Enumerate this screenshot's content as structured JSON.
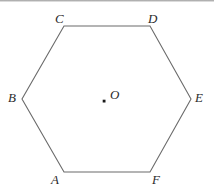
{
  "figure": {
    "name": "regular-hexagon-with-center",
    "background_color": "#ffffff",
    "stroke_color": "#6b6b6b",
    "label_color": "#2b2b2b",
    "center_dot_color": "#1a1a1a",
    "vertices": [
      {
        "id": "C",
        "label": "C",
        "x": 64,
        "y": 26
      },
      {
        "id": "D",
        "label": "D",
        "x": 150,
        "y": 26
      },
      {
        "id": "E",
        "label": "E",
        "x": 191,
        "y": 99
      },
      {
        "id": "F",
        "label": "F",
        "x": 150,
        "y": 172
      },
      {
        "id": "A",
        "label": "A",
        "x": 64,
        "y": 172
      },
      {
        "id": "B",
        "label": "B",
        "x": 22,
        "y": 99
      }
    ],
    "center": {
      "id": "O",
      "label": "O",
      "x": 104,
      "y": 101
    },
    "polygon_points": "64,26 150,26 191,99 150,172 64,172 22,99"
  }
}
